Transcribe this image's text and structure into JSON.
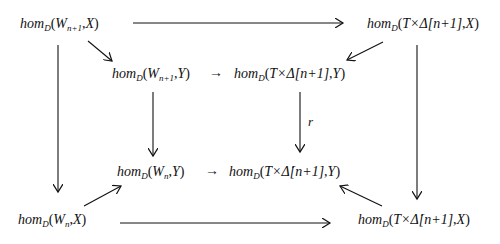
{
  "diagram": {
    "type": "commutative-diagram",
    "nodes": [
      {
        "id": "outer_tl",
        "hom": "hom",
        "sub": "D",
        "open": "(",
        "arg1": "W",
        "arg1_sub": "n+1",
        "sep": ",",
        "arg2": "X",
        "close": ")"
      },
      {
        "id": "outer_tr",
        "hom": "hom",
        "sub": "D",
        "open": "(",
        "arg1": "T×Δ[n+1]",
        "sep": ",",
        "arg2": "X",
        "close": ")"
      },
      {
        "id": "inner_tl",
        "hom": "hom",
        "sub": "D",
        "open": "(",
        "arg1": "W",
        "arg1_sub": "n+1",
        "sep": ",",
        "arg2": "Y",
        "close": ")"
      },
      {
        "id": "inner_tr",
        "hom": "hom",
        "sub": "D",
        "open": "(",
        "arg1": "T×Δ[n+1]",
        "sep": ",",
        "arg2": "Y",
        "close": ")"
      },
      {
        "id": "inner_bl",
        "hom": "hom",
        "sub": "D",
        "open": "(",
        "arg1": "W",
        "arg1_sub": "n",
        "sep": ",",
        "arg2": "Y",
        "close": ")"
      },
      {
        "id": "inner_br",
        "hom": "hom",
        "sub": "D",
        "open": "(",
        "arg1": "T×Δ̇[n+1]",
        "sep": ",",
        "arg2": "Y",
        "close": ")"
      },
      {
        "id": "outer_bl",
        "hom": "hom",
        "sub": "D",
        "open": "(",
        "arg1": "W",
        "arg1_sub": "n",
        "sep": ",",
        "arg2": "X",
        "close": ")"
      },
      {
        "id": "outer_br",
        "hom": "hom",
        "sub": "D",
        "open": "(",
        "arg1": "T×Δ̇[n+1]",
        "sep": ",",
        "arg2": "X",
        "close": ")"
      }
    ],
    "edges": [
      {
        "from": "outer_tl",
        "to": "outer_tr",
        "label": ""
      },
      {
        "from": "outer_tl",
        "to": "inner_tl",
        "label": ""
      },
      {
        "from": "outer_tr",
        "to": "inner_tr",
        "label": ""
      },
      {
        "from": "inner_tl",
        "to": "inner_tr",
        "label": ""
      },
      {
        "from": "outer_tl",
        "to": "outer_bl",
        "label": ""
      },
      {
        "from": "outer_tr",
        "to": "outer_br",
        "label": ""
      },
      {
        "from": "inner_tl",
        "to": "inner_bl",
        "label": ""
      },
      {
        "from": "inner_tr",
        "to": "inner_br",
        "label": "r"
      },
      {
        "from": "inner_bl",
        "to": "inner_br",
        "label": ""
      },
      {
        "from": "outer_bl",
        "to": "inner_bl",
        "label": ""
      },
      {
        "from": "outer_br",
        "to": "inner_br",
        "label": ""
      },
      {
        "from": "outer_bl",
        "to": "outer_br",
        "label": ""
      }
    ],
    "inline_arrow_glyph": "→",
    "edge_label_r": "r"
  }
}
